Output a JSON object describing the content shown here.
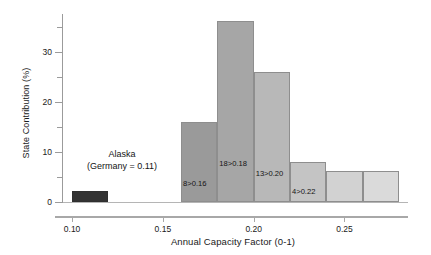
{
  "chart_data": {
    "type": "bar",
    "title": "",
    "subtitle": "",
    "xlabel": "Annual Capacity Factor (0-1)",
    "ylabel": "State Contribution (%)",
    "xlim": [
      0.095,
      0.285
    ],
    "ylim": [
      0,
      37.5
    ],
    "grid": false,
    "legend": null,
    "x_ticks": [
      "0.10",
      "0.15",
      "0.20",
      "0.25"
    ],
    "x_tick_values": [
      0.1,
      0.15,
      0.2,
      0.25
    ],
    "x_minor_tick_values": [
      0.125,
      0.175,
      0.225,
      0.275
    ],
    "y_ticks": [
      "0",
      "10",
      "20",
      "30"
    ],
    "y_tick_values": [
      0,
      10,
      20,
      30
    ],
    "y_minor_tick_values": [
      5,
      15,
      25,
      35
    ],
    "bins": [
      {
        "name": "alaska",
        "x_start": 0.1,
        "x_end": 0.12,
        "value": 2.2,
        "label": "",
        "color": "#333333"
      },
      {
        "name": "bin-016",
        "x_start": 0.16,
        "x_end": 0.18,
        "value": 15.9,
        "label": "8>0.16",
        "color": "#9a9a9a"
      },
      {
        "name": "bin-018",
        "x_start": 0.18,
        "x_end": 0.2,
        "value": 36.2,
        "label": "18>0.18",
        "color": "#a6a6a6"
      },
      {
        "name": "bin-020",
        "x_start": 0.2,
        "x_end": 0.22,
        "value": 26.0,
        "label": "13>0.20",
        "color": "#b8b8b8"
      },
      {
        "name": "bin-022",
        "x_start": 0.22,
        "x_end": 0.24,
        "value": 8.0,
        "label": "4>0.22",
        "color": "#c4c4c4"
      },
      {
        "name": "bin-024",
        "x_start": 0.24,
        "x_end": 0.26,
        "value": 6.1,
        "label": "",
        "color": "#d2d2d2"
      },
      {
        "name": "bin-026",
        "x_start": 0.26,
        "x_end": 0.28,
        "value": 6.1,
        "label": "",
        "color": "#dadada"
      }
    ]
  },
  "annotation": {
    "line1": "Alaska",
    "line2": "(Germany = 0.11)"
  },
  "colors": {
    "axis": "#9b9b9b",
    "text": "#141414",
    "bar_edge": "#8e8e8e",
    "alaska": "#333333"
  }
}
